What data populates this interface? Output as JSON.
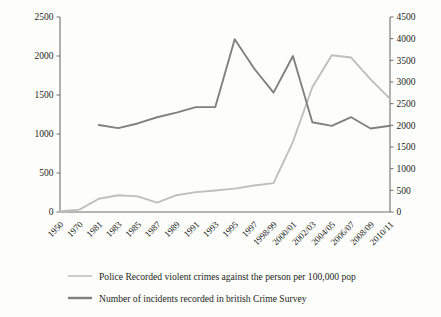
{
  "chart_data": {
    "type": "line",
    "title": "",
    "subtitle": "",
    "xlabel": "",
    "ylabel": "",
    "grid": false,
    "legend_position": "bottom-left",
    "categories": [
      "1950",
      "1970",
      "1981",
      "1983",
      "1985",
      "1987",
      "1989",
      "1991",
      "1993",
      "1995",
      "1997",
      "1998/99",
      "2000/01",
      "2002/03",
      "2004/05",
      "2006/07",
      "2008/09",
      "2010/11"
    ],
    "left_axis": {
      "label": "",
      "ylim": [
        0,
        2500
      ],
      "ticks": [
        0,
        500,
        1000,
        1500,
        2000,
        2500
      ]
    },
    "right_axis": {
      "label": "",
      "ylim": [
        0,
        4500
      ],
      "ticks": [
        0,
        500,
        1000,
        1500,
        2000,
        2500,
        3000,
        3500,
        4000,
        4500
      ]
    },
    "series": [
      {
        "name": "Police Recorded violent crimes against the person per 100,000 pop",
        "axis": "left",
        "color": "#bfbfbf",
        "stroke_width": 1.9,
        "x": [
          "1950",
          "1970",
          "1981",
          "1983",
          "1985",
          "1987",
          "1989",
          "1991",
          "1993",
          "1995",
          "1997",
          "1998/99",
          "2000/01",
          "2002/03",
          "2004/05",
          "2006/07",
          "2008/09",
          "2010/11"
        ],
        "values": [
          10,
          30,
          170,
          215,
          200,
          120,
          215,
          255,
          275,
          300,
          340,
          370,
          900,
          1600,
          2010,
          1980,
          1700,
          1450
        ]
      },
      {
        "name": "Number of incidents recorded in british Crime Survey",
        "axis": "left",
        "color": "#808080",
        "stroke_width": 1.9,
        "x": [
          "1981",
          "1983",
          "1985",
          "1987",
          "1989",
          "1991",
          "1993",
          "1995",
          "1997",
          "1998/99",
          "2000/01",
          "2002/03",
          "2004/05",
          "2006/07",
          "2008/09",
          "2010/11"
        ],
        "values": [
          1115,
          1075,
          1135,
          1215,
          1275,
          1345,
          1345,
          2215,
          1840,
          1530,
          2000,
          1150,
          1105,
          1215,
          1070,
          1105
        ]
      }
    ],
    "legend": [
      {
        "label": "Police Recorded violent crimes against the person per 100,000 pop",
        "color": "#bfbfbf",
        "width": 1.6
      },
      {
        "label": "Number of incidents recorded in british Crime Survey",
        "color": "#808080",
        "width": 2.4
      }
    ]
  },
  "colors": {
    "background": "#fdfdfc",
    "axis": "#6f6f6f",
    "text": "#231f20",
    "series_light": "#bfbfbf",
    "series_dark": "#808080"
  }
}
